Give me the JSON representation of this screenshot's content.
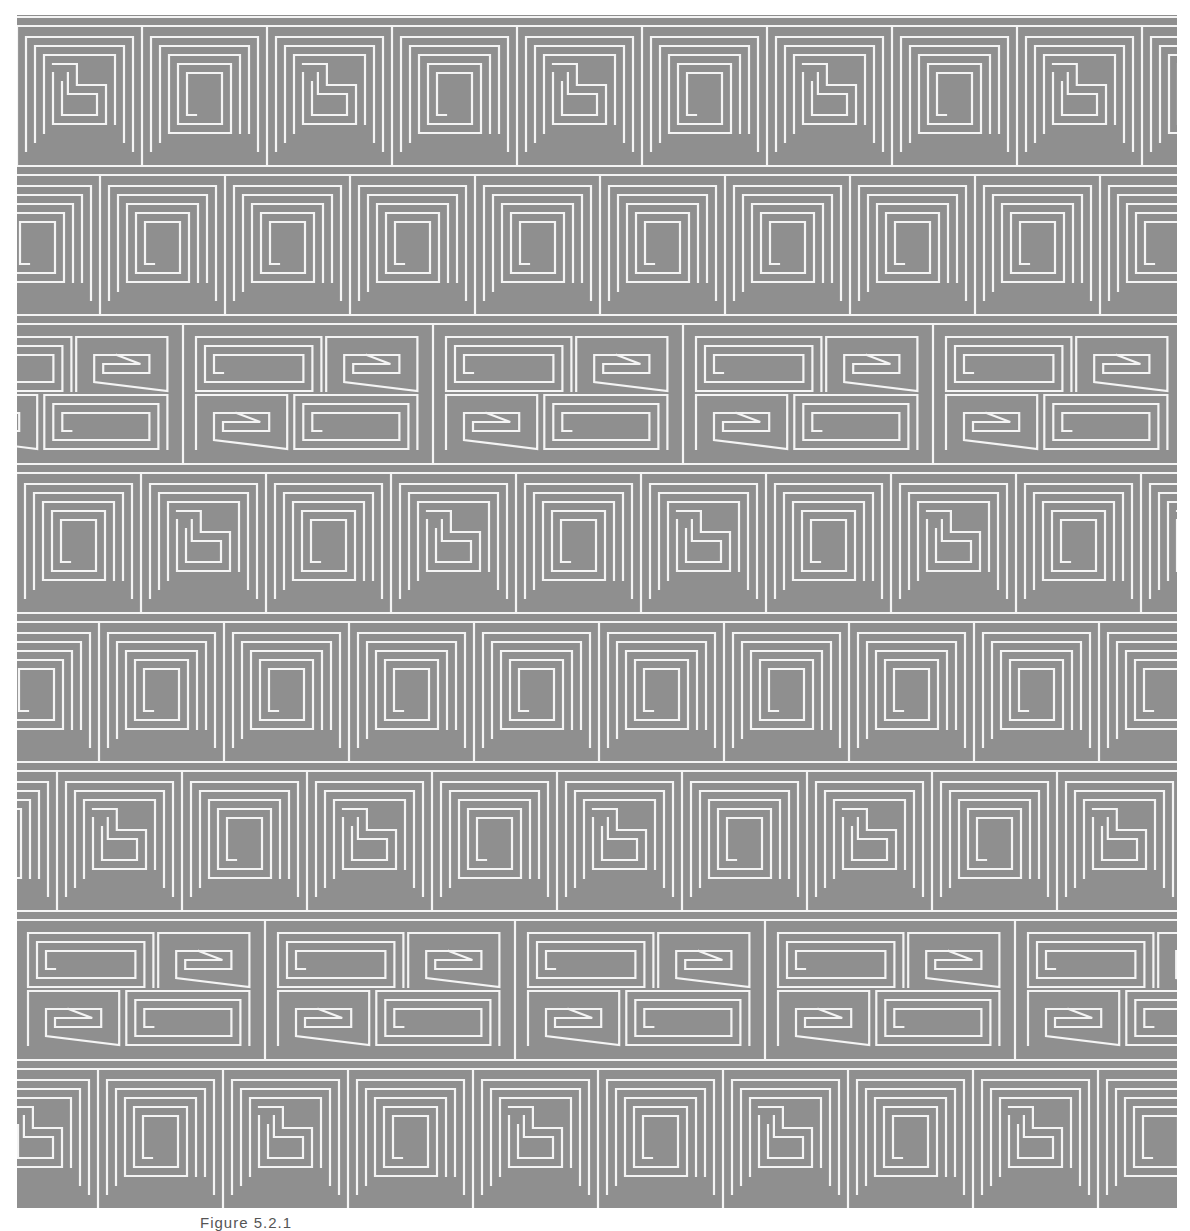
{
  "figure": {
    "background_color": "#8f8f8f",
    "line_color": "#f4f4f4",
    "line_width": 2.2,
    "motif": "interlocking meander / Greek-key spirals",
    "rows": 8,
    "row_height": 149,
    "tile_width": 125,
    "spacing": 9,
    "row_offset_step": 42,
    "row_kinds": [
      "L-spiral",
      "square-spiral",
      "double-band",
      "L-spiral",
      "square-spiral",
      "L-spiral",
      "double-band",
      "L-spiral"
    ]
  },
  "caption": {
    "text": "Figure 5.2.1"
  }
}
